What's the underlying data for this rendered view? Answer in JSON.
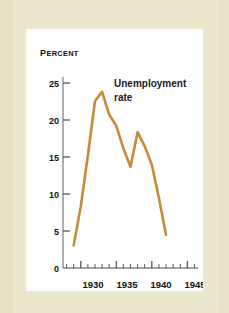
{
  "figure": {
    "background_color": "#ebe8ce",
    "panel_color": "#ffffff"
  },
  "chart_data": {
    "type": "line",
    "title": "",
    "subtitle": "",
    "xlabel": "",
    "ylabel": "Percent",
    "ylabel_display": {
      "first_letter": "P",
      "rest": "ERCENT"
    },
    "series_label": {
      "line1": "Unemployment",
      "line2": "rate"
    },
    "line_color": "#c8893a",
    "grid": false,
    "legend_position": "inline-annotation",
    "xlim": [
      1927.5,
      1946.5
    ],
    "ylim": [
      0,
      27
    ],
    "xticks_major": [
      1930,
      1935,
      1940,
      1945
    ],
    "xtick_labels": [
      "1930",
      "1935",
      "1940",
      "1945"
    ],
    "xticks_minor_start": 1928,
    "xticks_minor_end": 1946,
    "yticks": [
      0,
      5,
      10,
      15,
      20,
      25
    ],
    "ytick_labels": [
      "0",
      "5",
      "10",
      "15",
      "20",
      "25"
    ],
    "x": [
      1929,
      1930,
      1931,
      1932,
      1933,
      1934,
      1935,
      1936,
      1937,
      1938,
      1939,
      1940,
      1941,
      1942
    ],
    "values": [
      3.2,
      8.7,
      15.9,
      23.6,
      24.9,
      21.7,
      20.1,
      16.9,
      14.3,
      19.2,
      17.2,
      14.6,
      9.9,
      4.7
    ],
    "annotations": [
      {
        "text": "Unemployment rate",
        "x": 1934.2,
        "y": 24.0
      }
    ]
  }
}
